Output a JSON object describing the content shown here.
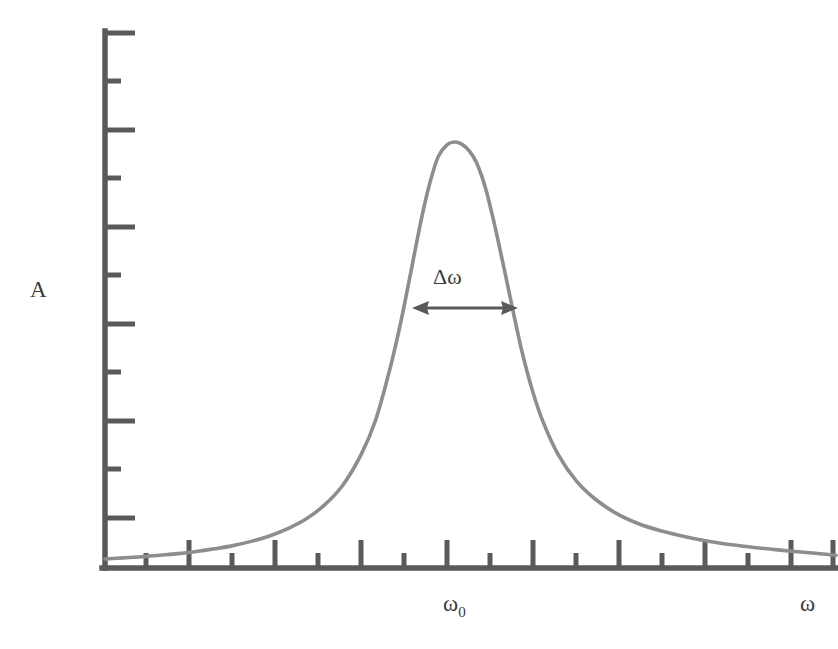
{
  "figure": {
    "background_color": "#ffffff",
    "axis_color": "#5a5a5a",
    "curve_color": "#8d8d8d",
    "annotation_color": "#5a5a5a",
    "text_color": "#3d3d3d"
  },
  "labels": {
    "y_axis": "A",
    "x_axis_peak": "ω",
    "x_axis_peak_sub": "0",
    "x_axis": "ω",
    "linewidth_annotation": "Δω"
  },
  "chart_data": {
    "type": "line",
    "title": "",
    "xlabel": "ω",
    "ylabel": "A",
    "grid": false,
    "legend": false,
    "annotations": [
      {
        "text": "Δω",
        "kind": "double-headed-arrow",
        "meaning": "full width at half maximum of the resonance peak",
        "x_start": 0.426,
        "x_end": 0.563,
        "y": 0.486
      },
      {
        "text": "ω₀",
        "kind": "axis-tick-label",
        "meaning": "resonance frequency at peak center",
        "x": 0.488
      }
    ],
    "xlim": [
      0,
      1
    ],
    "ylim": [
      0,
      1
    ],
    "x_ticks_major": [
      0.0,
      0.118,
      0.235,
      0.353,
      0.471,
      0.588,
      0.706,
      0.824,
      0.941
    ],
    "x_ticks_minor": [
      0.059,
      0.176,
      0.294,
      0.412,
      0.529,
      0.647,
      0.765,
      0.882,
      1.0
    ],
    "y_ticks_major": [
      0.0,
      0.182,
      0.364,
      0.545,
      0.727,
      0.909
    ],
    "y_ticks_minor": [
      0.091,
      0.273,
      0.455,
      0.636,
      0.818,
      1.0
    ],
    "curve": {
      "name": "resonance amplitude",
      "function": "lorentzian",
      "peak_x": 0.488,
      "peak_y": 0.796,
      "half_width": 0.0685,
      "baseline_y": 0.015,
      "x": [
        0.0,
        0.025,
        0.05,
        0.075,
        0.1,
        0.125,
        0.15,
        0.175,
        0.2,
        0.225,
        0.25,
        0.275,
        0.3,
        0.325,
        0.35,
        0.37,
        0.39,
        0.405,
        0.42,
        0.432,
        0.444,
        0.456,
        0.468,
        0.478,
        0.488,
        0.498,
        0.508,
        0.52,
        0.532,
        0.544,
        0.556,
        0.57,
        0.585,
        0.6,
        0.62,
        0.645,
        0.67,
        0.7,
        0.73,
        0.76,
        0.8,
        0.84,
        0.88,
        0.92,
        0.96,
        1.0
      ],
      "y": [
        0.017,
        0.019,
        0.021,
        0.024,
        0.027,
        0.031,
        0.036,
        0.042,
        0.05,
        0.06,
        0.074,
        0.092,
        0.118,
        0.155,
        0.212,
        0.277,
        0.375,
        0.464,
        0.567,
        0.65,
        0.721,
        0.773,
        0.795,
        0.8,
        0.796,
        0.784,
        0.762,
        0.716,
        0.65,
        0.575,
        0.497,
        0.409,
        0.332,
        0.272,
        0.213,
        0.163,
        0.13,
        0.102,
        0.083,
        0.07,
        0.057,
        0.047,
        0.04,
        0.034,
        0.029,
        0.024
      ]
    }
  }
}
